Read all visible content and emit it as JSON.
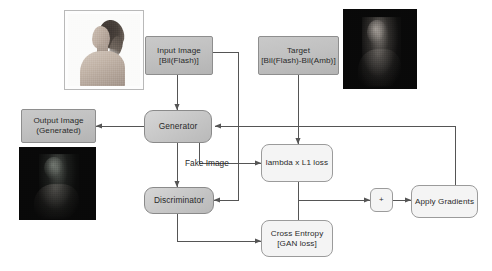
{
  "diagram": {
    "colors": {
      "node_slate": "#c4c4c4",
      "node_model": "#cbcbcb",
      "node_pale": "#f4f4f4",
      "stroke": "#555555",
      "text": "#2a2a2a",
      "canvas": "#ffffff"
    },
    "nodes": {
      "input_image": {
        "label": "Input Image\n[Bil(Flash)]"
      },
      "target": {
        "label": "Target\n[Bil(Flash)-Bil(Amb)]"
      },
      "generator": {
        "label": "Generator"
      },
      "output_image": {
        "label": "Output Image\n(Generated)"
      },
      "discriminator": {
        "label": "Discriminator"
      },
      "l1_loss": {
        "label": "lambda x L1 loss"
      },
      "cross_entropy": {
        "label": "Cross Entropy\n[GAN loss]"
      },
      "sum": {
        "label": "+"
      },
      "apply_gradients": {
        "label": "Apply Gradients"
      }
    },
    "edge_labels": {
      "fake_image": "Fake Image"
    },
    "thumbnails": {
      "input_photo": {
        "name": "input-flash-photo",
        "style": "light"
      },
      "target_photo": {
        "name": "target-residual-photo",
        "style": "dark"
      },
      "output_photo": {
        "name": "generated-output-photo",
        "style": "dark"
      }
    }
  }
}
